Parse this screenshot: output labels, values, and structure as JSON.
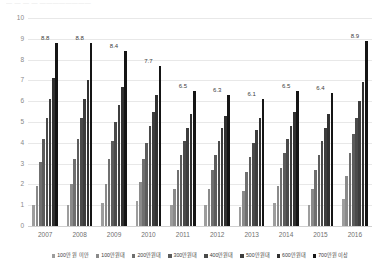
{
  "top_clip_text": "—  —   —    —      ————————",
  "chart_data": {
    "type": "bar",
    "title": "",
    "subtitle": "",
    "xlabel": "",
    "ylabel": "",
    "ylim": [
      0,
      10
    ],
    "yticks": [
      "0",
      "1",
      "2",
      "3",
      "4",
      "5",
      "6",
      "7",
      "8",
      "9",
      "10"
    ],
    "grid": true,
    "legend_position": "bottom",
    "categories": [
      "2007",
      "2008",
      "2009",
      "2010",
      "2011",
      "2012",
      "2013",
      "2014",
      "2015",
      "2016"
    ],
    "series": [
      {
        "name": "100만 원 미만",
        "color": "#9d9d9d",
        "values": [
          1.0,
          1.0,
          1.1,
          1.2,
          1.0,
          1.0,
          0.9,
          1.1,
          1.0,
          1.3
        ]
      },
      {
        "name": "100만원대",
        "color": "#8a8a8a",
        "values": [
          1.9,
          2.0,
          2.0,
          2.1,
          1.8,
          1.8,
          1.7,
          1.9,
          1.8,
          2.4
        ]
      },
      {
        "name": "200만원대",
        "color": "#6f6f6f",
        "values": [
          3.1,
          3.2,
          3.2,
          3.2,
          2.7,
          2.7,
          2.6,
          2.8,
          2.7,
          3.5
        ]
      },
      {
        "name": "300만원대",
        "color": "#5c5c5c",
        "values": [
          4.2,
          4.2,
          4.1,
          4.0,
          3.4,
          3.4,
          3.3,
          3.5,
          3.4,
          4.4
        ]
      },
      {
        "name": "400만원대",
        "color": "#4a4a4a",
        "values": [
          5.2,
          5.2,
          5.0,
          4.8,
          4.1,
          4.1,
          4.0,
          4.2,
          4.1,
          5.2
        ]
      },
      {
        "name": "500만원대",
        "color": "#3d3d3d",
        "values": [
          6.1,
          6.1,
          5.8,
          5.5,
          4.7,
          4.7,
          4.6,
          4.8,
          4.7,
          6.0
        ]
      },
      {
        "name": "600만원대",
        "color": "#313131",
        "values": [
          7.1,
          7.0,
          6.7,
          6.3,
          5.4,
          5.3,
          5.2,
          5.5,
          5.4,
          6.9
        ]
      },
      {
        "name": "700만원 이상",
        "color": "#151515",
        "values": [
          8.8,
          8.8,
          8.4,
          7.7,
          6.5,
          6.3,
          6.1,
          6.5,
          6.4,
          8.9
        ]
      }
    ],
    "data_labels": [
      "8.8",
      "8.8",
      "8.4",
      "7.7",
      "6.5",
      "6.3",
      "6.1",
      "6.5",
      "6.4",
      "8.9"
    ]
  }
}
